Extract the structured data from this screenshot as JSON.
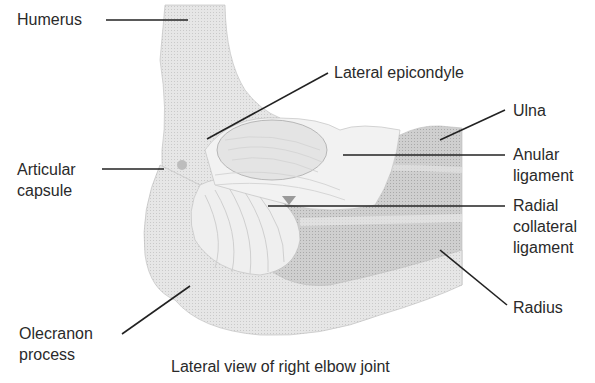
{
  "diagram": {
    "caption": "Lateral view of right elbow joint",
    "labels": {
      "humerus": "Humerus",
      "lateral_epicondyle": "Lateral epicondyle",
      "ulna": "Ulna",
      "articular_capsule_1": "Articular",
      "articular_capsule_2": "capsule",
      "anular_ligament_1": "Anular",
      "anular_ligament_2": "ligament",
      "radial_collateral_1": "Radial",
      "radial_collateral_2": "collateral",
      "radial_collateral_3": "ligament",
      "radius": "Radius",
      "olecranon_1": "Olecranon",
      "olecranon_2": "process"
    },
    "colors": {
      "bone_light": "#e8e8e8",
      "bone_mid": "#d4d4d4",
      "forearm": "#c8c8c8",
      "leader": "#222222"
    }
  }
}
